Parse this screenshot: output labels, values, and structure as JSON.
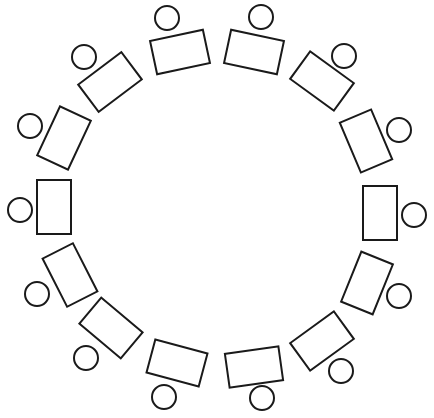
{
  "diagram": {
    "type": "seating-layout",
    "canvas": {
      "width": 434,
      "height": 418,
      "background": "#ffffff"
    },
    "stroke_color": "#1a1a1a",
    "desk_size": {
      "width": 54,
      "height": 34
    },
    "chair_radius": 12,
    "stations": [
      {
        "desk": {
          "cx": 180,
          "cy": 52,
          "rotate": -12
        },
        "chair": {
          "cx": 167,
          "cy": 18
        }
      },
      {
        "desk": {
          "cx": 254,
          "cy": 52,
          "rotate": 12
        },
        "chair": {
          "cx": 261,
          "cy": 17
        }
      },
      {
        "desk": {
          "cx": 322,
          "cy": 81,
          "rotate": 36
        },
        "chair": {
          "cx": 344,
          "cy": 56
        }
      },
      {
        "desk": {
          "cx": 366,
          "cy": 141,
          "rotate": 67
        },
        "chair": {
          "cx": 399,
          "cy": 130
        }
      },
      {
        "desk": {
          "cx": 380,
          "cy": 213,
          "rotate": 90
        },
        "chair": {
          "cx": 414,
          "cy": 215
        }
      },
      {
        "desk": {
          "cx": 367,
          "cy": 283,
          "rotate": 112
        },
        "chair": {
          "cx": 399,
          "cy": 296
        }
      },
      {
        "desk": {
          "cx": 322,
          "cy": 341,
          "rotate": 144
        },
        "chair": {
          "cx": 341,
          "cy": 371
        }
      },
      {
        "desk": {
          "cx": 254,
          "cy": 367,
          "rotate": 172
        },
        "chair": {
          "cx": 262,
          "cy": 398
        }
      },
      {
        "desk": {
          "cx": 177,
          "cy": 363,
          "rotate": 195
        },
        "chair": {
          "cx": 164,
          "cy": 397
        }
      },
      {
        "desk": {
          "cx": 111,
          "cy": 328,
          "rotate": 220
        },
        "chair": {
          "cx": 86,
          "cy": 358
        }
      },
      {
        "desk": {
          "cx": 70,
          "cy": 275,
          "rotate": 243
        },
        "chair": {
          "cx": 37,
          "cy": 294
        }
      },
      {
        "desk": {
          "cx": 54,
          "cy": 207,
          "rotate": 270
        },
        "chair": {
          "cx": 20,
          "cy": 210
        }
      },
      {
        "desk": {
          "cx": 64,
          "cy": 138,
          "rotate": 295
        },
        "chair": {
          "cx": 30,
          "cy": 126
        }
      },
      {
        "desk": {
          "cx": 110,
          "cy": 82,
          "rotate": 323
        },
        "chair": {
          "cx": 84,
          "cy": 57
        }
      }
    ]
  }
}
